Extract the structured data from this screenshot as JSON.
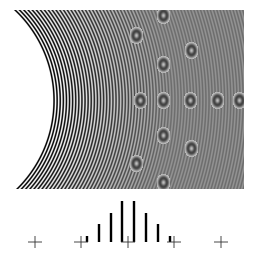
{
  "figure": {
    "pattern": {
      "region": {
        "x": 13,
        "y": 10,
        "width": 231,
        "height": 179
      },
      "arc_center": {
        "x": -71,
        "y": 100
      },
      "inner_radius": 123,
      "fringe_period_px": 3.1,
      "colors": {
        "dark": "#111111",
        "light": "#ffffff",
        "mid": "#808080"
      },
      "moire_spots": [
        {
          "x": 163,
          "y": 15
        },
        {
          "x": 136,
          "y": 35
        },
        {
          "x": 191,
          "y": 50
        },
        {
          "x": 163,
          "y": 64
        },
        {
          "x": 140,
          "y": 100
        },
        {
          "x": 163,
          "y": 100
        },
        {
          "x": 190,
          "y": 100
        },
        {
          "x": 217,
          "y": 100
        },
        {
          "x": 239,
          "y": 100
        },
        {
          "x": 163,
          "y": 135
        },
        {
          "x": 191,
          "y": 148
        },
        {
          "x": 136,
          "y": 163
        },
        {
          "x": 163,
          "y": 182
        }
      ]
    },
    "axis": {
      "baseline_y": 242,
      "cross_markers_x": [
        35,
        81,
        128,
        174,
        221
      ]
    }
  },
  "chart_data": {
    "type": "bar",
    "title": "",
    "xlabel": "",
    "ylabel": "",
    "categories": [
      "-4",
      "-3",
      "-2",
      "-1",
      "1",
      "2",
      "3",
      "4"
    ],
    "x_positions": [
      87,
      99,
      111,
      122,
      134,
      146,
      158,
      170
    ],
    "values": [
      6,
      18,
      29,
      41,
      41,
      29,
      18,
      6
    ],
    "bar_color": "#000000",
    "grid": false,
    "tick_markers": "cross",
    "tick_positions": [
      35,
      81,
      128,
      174,
      221
    ]
  }
}
